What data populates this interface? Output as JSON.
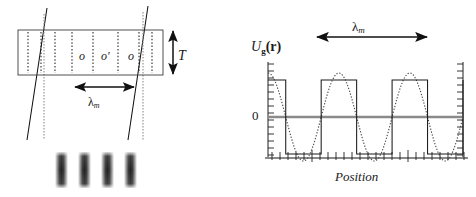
{
  "figure": {
    "title": "",
    "panels": [
      "standing-wave-medium-diagram",
      "grating-potential-plot"
    ]
  },
  "left_panel": {
    "name": "medium-cross-section",
    "thickness_label": "T",
    "period_label": "λ",
    "period_sub": "m",
    "zone_labels": [
      "o",
      "o′",
      "o"
    ],
    "box": {
      "x": 18,
      "y": 30,
      "width": 145,
      "height": 45
    },
    "dotted_lines_x": [
      28,
      41,
      55,
      72,
      93,
      118,
      139,
      152
    ],
    "gray_dotted_lines_x": [
      44,
      143
    ],
    "slanted_lines": [
      {
        "x_top": 47,
        "y_top": 8,
        "x_bottom": 27,
        "y_bottom": 140
      },
      {
        "x_top": 148,
        "y_top": 6,
        "x_bottom": 128,
        "y_bottom": 140
      }
    ],
    "span_arrow": {
      "x1": 75,
      "x2": 134,
      "y": 87
    },
    "thickness_arrow": {
      "x": 173,
      "y1": 30,
      "y2": 75
    },
    "fringes": {
      "name": "interference-fringe-pattern",
      "count": 4,
      "x_positions": [
        55,
        78,
        101,
        124
      ],
      "y": 152,
      "width": 13,
      "height": 36
    }
  },
  "right_panel": {
    "name": "potential-profile-plot",
    "y_axis_label": "U",
    "y_axis_label_sub": "g",
    "y_axis_label_arg": "(r)",
    "y_zero_tick": "0",
    "x_axis_label": "Position",
    "period_label": "λ",
    "period_sub": "m",
    "span_arrow": {
      "x1": 317,
      "x2": 427,
      "y": 37
    },
    "axes": {
      "left_x": 268,
      "right_x": 463,
      "top_y": 62,
      "bottom_y": 158,
      "zero_y": 117,
      "tick_count_y": 14,
      "tick_count_x": 25
    }
  },
  "chart_data": {
    "type": "line",
    "title": "",
    "xlabel": "Position",
    "ylabel": "U_g(r)",
    "grid": false,
    "legend": "none",
    "ylim": [
      -1.4,
      1.4
    ],
    "xlim": [
      0,
      2.75
    ],
    "yticks": [
      0
    ],
    "ytick_labels": [
      "0"
    ],
    "annotations": [
      {
        "text": "λ_m",
        "type": "span-arrow",
        "x_start": 0.625,
        "x_end": 1.625
      }
    ],
    "series": [
      {
        "name": "square-wave-potential",
        "style": "solid",
        "color": "#111111",
        "description": "Square wave, amplitude 1, period 1.0 (in units of lambda_m), high from x=0 to 0.25, low 0.25-0.75, repeating",
        "period": 1.0,
        "amplitude": 1.0,
        "duty_cycle": 0.5,
        "phase_offset": 0.0,
        "x": [
          0.0,
          0.25,
          0.25,
          0.75,
          0.75,
          1.25,
          1.25,
          1.75,
          1.75,
          2.25,
          2.25,
          2.75
        ],
        "y": [
          1,
          1,
          -1,
          -1,
          1,
          1,
          -1,
          -1,
          1,
          1,
          -1,
          -1
        ]
      },
      {
        "name": "sinusoidal-standing-wave",
        "style": "dotted",
        "color": "#555555",
        "description": "Cosine wave of same period as square wave, amplitude slightly larger",
        "period": 1.0,
        "amplitude": 1.18,
        "function": "1.18*cos(2*pi*x)"
      },
      {
        "name": "zero-baseline",
        "style": "solid-gray",
        "color": "#7a7a7a",
        "y_constant": 0
      }
    ]
  },
  "colors": {
    "ink": "#111111",
    "gray_line": "#7a7a7a",
    "dotted": "#2a2a2a",
    "fringe_dark": "#2b2b2b",
    "background": "#ffffff"
  }
}
